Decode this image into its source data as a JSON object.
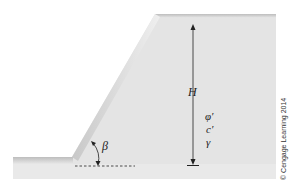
{
  "diagram": {
    "labels": {
      "height": "H",
      "friction_angle": "φ′",
      "cohesion": "c′",
      "unit_weight": "γ",
      "slope_angle": "β"
    },
    "copyright": "© Cengage Learning 2014",
    "colors": {
      "soil_fill": "#e6e6e6",
      "soil_edge_dark": "#c4c4c4",
      "soil_edge_light": "#f4f4f4",
      "line": "#222222"
    }
  }
}
